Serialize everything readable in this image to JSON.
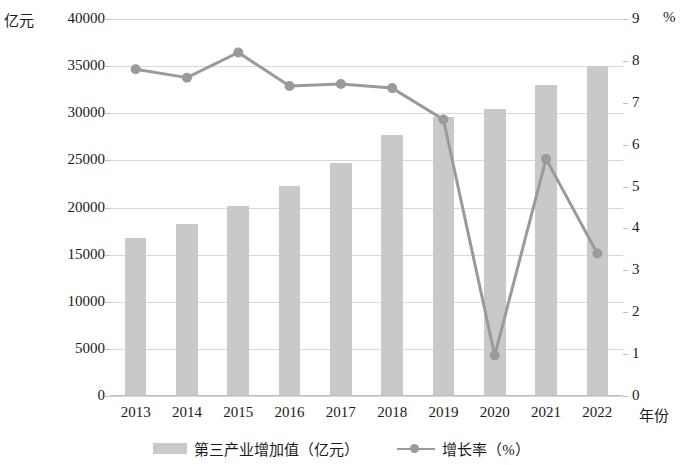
{
  "chart_data": {
    "type": "bar",
    "title": "",
    "subtitle": "",
    "xlabel": "年份",
    "ylabel": "亿元",
    "y2label": "%",
    "categories": [
      "2013",
      "2014",
      "2015",
      "2016",
      "2017",
      "2018",
      "2019",
      "2020",
      "2021",
      "2022"
    ],
    "ylim": [
      0,
      40000
    ],
    "y2lim": [
      0,
      9
    ],
    "yticks": [
      "0",
      "5000",
      "10000",
      "15000",
      "20000",
      "25000",
      "30000",
      "35000",
      "40000"
    ],
    "ytick_values": [
      0,
      5000,
      10000,
      15000,
      20000,
      25000,
      30000,
      35000,
      40000
    ],
    "y2ticks": [
      "0",
      "1",
      "2",
      "3",
      "4",
      "5",
      "6",
      "7",
      "8",
      "9"
    ],
    "y2tick_values": [
      0,
      1,
      2,
      3,
      4,
      5,
      6,
      7,
      8,
      9
    ],
    "grid": true,
    "legend_position": "bottom",
    "series": [
      {
        "name": "第三产业增加值（亿元）",
        "type": "bar",
        "axis": "left",
        "color": "#c9c9c9",
        "values": [
          16800,
          18300,
          20150,
          22250,
          24750,
          27650,
          29650,
          30500,
          33000,
          35050
        ]
      },
      {
        "name": "增长率（%）",
        "type": "line",
        "axis": "right",
        "color": "#9a9a9a",
        "values": [
          7.8,
          7.6,
          8.2,
          7.4,
          7.45,
          7.35,
          6.6,
          0.97,
          5.66,
          3.4
        ]
      }
    ]
  },
  "axes": {
    "left_unit": "亿元",
    "right_unit": "%",
    "x_unit": "年份"
  },
  "legend": {
    "items": [
      {
        "label": "第三产业增加值（亿元）",
        "marker": "bar-swatch"
      },
      {
        "label": "增长率（%）",
        "marker": "line-marker"
      }
    ]
  }
}
